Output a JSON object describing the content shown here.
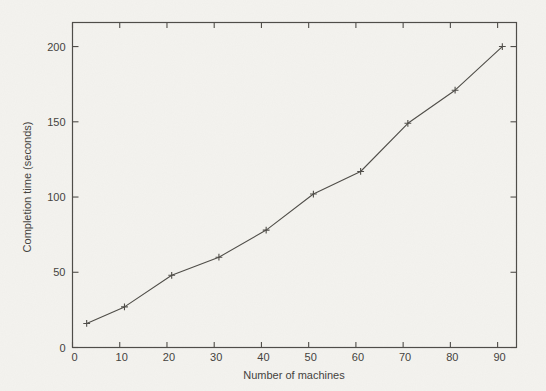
{
  "figure": {
    "background_color": "#f4f3ef",
    "ink_color": "#504e49",
    "text_color": "#45433e"
  },
  "chart_data": {
    "type": "line",
    "title": "",
    "xlabel": "Number of machines",
    "ylabel": "Completion time (seconds)",
    "x": [
      3,
      11,
      21,
      31,
      41,
      51,
      61,
      71,
      81,
      91
    ],
    "y": [
      16,
      27,
      48,
      60,
      78,
      102,
      117,
      149,
      171,
      200
    ],
    "series": [
      {
        "name": "completion-time",
        "values": [
          16,
          27,
          48,
          60,
          78,
          102,
          117,
          149,
          171,
          200
        ]
      }
    ],
    "marker": "plus",
    "line_style": "solid",
    "xlim": [
      0,
      94
    ],
    "ylim": [
      0,
      216
    ],
    "xticks": [
      0,
      10,
      20,
      30,
      40,
      50,
      60,
      70,
      80,
      90
    ],
    "yticks": [
      0,
      50,
      100,
      150,
      200
    ],
    "grid": false,
    "legend": null,
    "frame": "box-with-inward-ticks-all-sides"
  }
}
